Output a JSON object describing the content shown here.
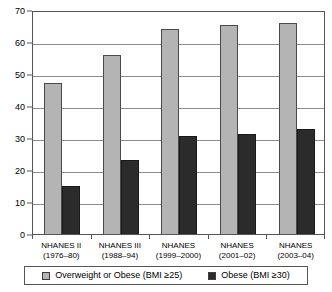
{
  "chart_data": {
    "type": "bar",
    "title": "",
    "subtitle": "",
    "xlabel": "",
    "ylabel": "",
    "ylim": [
      0,
      70
    ],
    "ytick_step": 10,
    "yticks": [
      "0",
      "10",
      "20",
      "30",
      "40",
      "50",
      "60",
      "70"
    ],
    "grid": true,
    "legend_position": "bottom",
    "categories": [
      "NHANES II (1976–80)",
      "NHANES III (1988–94)",
      "NHANES (1999–2000)",
      "NHANES (2001–02)",
      "NHANES (2003–04)"
    ],
    "category_lines": [
      {
        "line1": "NHANES II",
        "line2": "(1976–80)"
      },
      {
        "line1": "NHANES III",
        "line2": "(1988–94)"
      },
      {
        "line1": "NHANES",
        "line2": "(1999–2000)"
      },
      {
        "line1": "NHANES",
        "line2": "(2001–02)"
      },
      {
        "line1": "NHANES",
        "line2": "(2003–04)"
      }
    ],
    "series": [
      {
        "name": "Overweight or Obese (BMI ≥25)",
        "color": "#b4b4b4",
        "values": [
          47.1,
          55.9,
          64.1,
          65.4,
          66.0
        ]
      },
      {
        "name": "Obese (BMI ≥30)",
        "color": "#2b2b2b",
        "values": [
          15.0,
          23.2,
          30.6,
          31.3,
          32.9
        ]
      }
    ]
  },
  "legend": {
    "items": [
      {
        "label": "Overweight or Obese (BMI ≥25)",
        "swatch": "light-gray-square-icon"
      },
      {
        "label": "Obese (BMI ≥30)",
        "swatch": "dark-gray-square-icon"
      }
    ]
  }
}
